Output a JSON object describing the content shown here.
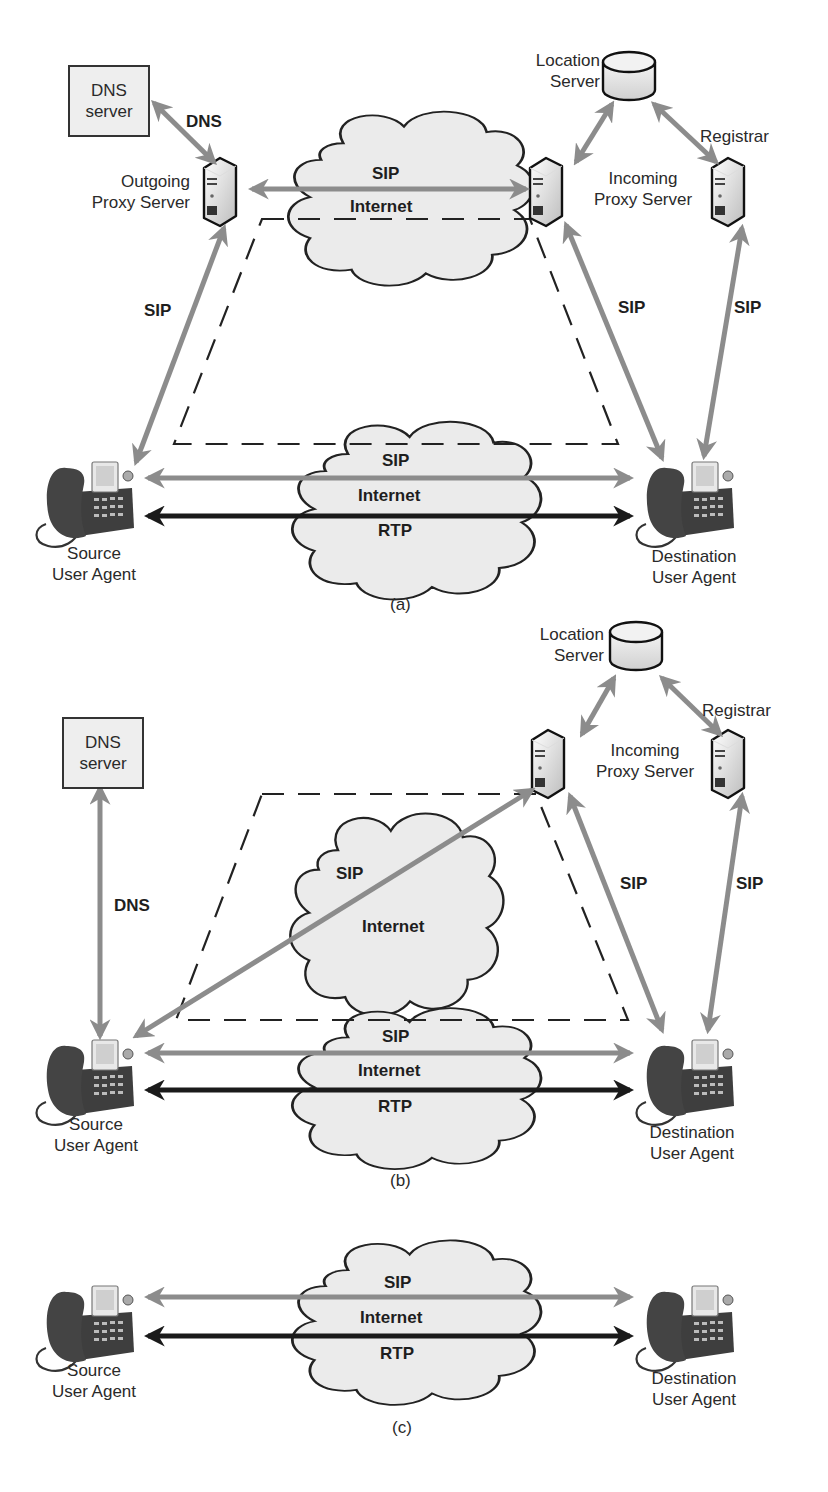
{
  "figure": {
    "colors": {
      "sip_arrow": "#8c8c8c",
      "rtp_arrow": "#1a1a1a",
      "cloud_fill": "#ebebeb",
      "outline": "#222222",
      "dashed_boundary": "#222222"
    }
  },
  "panel_a": {
    "caption": "(a)",
    "dns_server": "DNS\nserver",
    "dns_link": "DNS",
    "outgoing_proxy": "Outgoing\nProxy Server",
    "location_server": "Location\nServer",
    "registrar": "Registrar",
    "incoming_proxy": "Incoming\nProxy Server",
    "top_cloud": {
      "protocol": "SIP",
      "network": "Internet"
    },
    "left_link": "SIP",
    "mid_right_link": "SIP",
    "far_right_link": "SIP",
    "bottom_cloud": {
      "sip": "SIP",
      "network": "Internet",
      "rtp": "RTP"
    },
    "source": "Source\nUser Agent",
    "destination": "Destination\nUser Agent"
  },
  "panel_b": {
    "caption": "(b)",
    "dns_server": "DNS\nserver",
    "dns_link": "DNS",
    "location_server": "Location\nServer",
    "registrar": "Registrar",
    "incoming_proxy": "Incoming\nProxy Server",
    "middle_cloud": {
      "protocol": "SIP",
      "network": "Internet"
    },
    "mid_right_link": "SIP",
    "far_right_link": "SIP",
    "bottom_cloud": {
      "sip": "SIP",
      "network": "Internet",
      "rtp": "RTP"
    },
    "source": "Source\nUser Agent",
    "destination": "Destination\nUser Agent"
  },
  "panel_c": {
    "caption": "(c)",
    "cloud": {
      "sip": "SIP",
      "network": "Internet",
      "rtp": "RTP"
    },
    "source": "Source\nUser Agent",
    "destination": "Destination\nUser Agent"
  },
  "icons": {
    "phone": "ip-phone-icon",
    "server": "server-tower-icon",
    "database": "database-cylinder-icon",
    "cloud": "cloud-icon"
  }
}
